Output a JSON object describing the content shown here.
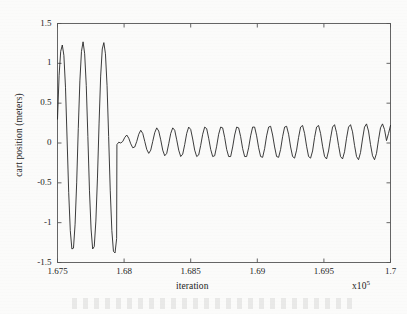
{
  "chart_data": {
    "type": "line",
    "title": "",
    "xlabel": "iteration",
    "ylabel": "cart position (meters)",
    "x_exponent": "x10",
    "x_exponent_power": "5",
    "xlim": [
      1.675,
      1.7
    ],
    "ylim": [
      -1.5,
      1.5
    ],
    "xticks": [
      "1.675",
      "1.68",
      "1.685",
      "1.69",
      "1.695",
      "1.7"
    ],
    "xtick_values": [
      1.675,
      1.68,
      1.685,
      1.69,
      1.695,
      1.7
    ],
    "yticks": [
      "1.5",
      "1",
      "0.5",
      "0",
      "-0.5",
      "-1",
      "-1.5"
    ],
    "ytick_values": [
      1.5,
      1,
      0.5,
      0,
      -0.5,
      -1,
      -1.5
    ],
    "grid": false,
    "legend": null,
    "line_color": "#262626",
    "line_width": 0.9,
    "series": [
      {
        "name": "cart position",
        "description": "Large amplitude oscillation for first three cycles then abrupt transition to small sustained oscillation",
        "points": [
          [
            1.675,
            0.3
          ],
          [
            1.67512,
            0.85
          ],
          [
            1.67524,
            1.15
          ],
          [
            1.67536,
            1.23
          ],
          [
            1.67548,
            1.1
          ],
          [
            1.6756,
            0.7
          ],
          [
            1.67572,
            0.05
          ],
          [
            1.67584,
            -0.62
          ],
          [
            1.67596,
            -1.1
          ],
          [
            1.67608,
            -1.33
          ],
          [
            1.6762,
            -1.32
          ],
          [
            1.67632,
            -1.02
          ],
          [
            1.67644,
            -0.5
          ],
          [
            1.67656,
            0.18
          ],
          [
            1.67668,
            0.78
          ],
          [
            1.6768,
            1.15
          ],
          [
            1.67692,
            1.27
          ],
          [
            1.67704,
            1.12
          ],
          [
            1.67716,
            0.72
          ],
          [
            1.67728,
            0.08
          ],
          [
            1.6774,
            -0.6
          ],
          [
            1.67752,
            -1.08
          ],
          [
            1.67764,
            -1.33
          ],
          [
            1.67776,
            -1.3
          ],
          [
            1.67788,
            -0.98
          ],
          [
            1.678,
            -0.44
          ],
          [
            1.67812,
            0.24
          ],
          [
            1.67824,
            0.84
          ],
          [
            1.67836,
            1.18
          ],
          [
            1.67848,
            1.26
          ],
          [
            1.6786,
            1.12
          ],
          [
            1.67872,
            0.72
          ],
          [
            1.67884,
            0.08
          ],
          [
            1.67896,
            -0.6
          ],
          [
            1.67908,
            -1.1
          ],
          [
            1.6792,
            -1.36
          ],
          [
            1.67932,
            -1.38
          ],
          [
            1.67944,
            -1.2
          ],
          [
            1.67946,
            -0.02
          ],
          [
            1.6796,
            0.01
          ],
          [
            1.67975,
            0.0
          ],
          [
            1.6799,
            0.02
          ],
          [
            1.68005,
            0.07
          ],
          [
            1.6802,
            0.1
          ],
          [
            1.68035,
            0.06
          ],
          [
            1.6805,
            -0.01
          ],
          [
            1.68065,
            -0.06
          ],
          [
            1.6808,
            -0.05
          ],
          [
            1.68095,
            0.02
          ],
          [
            1.6811,
            0.11
          ],
          [
            1.68125,
            0.16
          ],
          [
            1.6814,
            0.12
          ],
          [
            1.68155,
            0.02
          ],
          [
            1.6817,
            -0.08
          ],
          [
            1.68185,
            -0.13
          ],
          [
            1.682,
            -0.09
          ],
          [
            1.68215,
            0.02
          ],
          [
            1.6823,
            0.13
          ],
          [
            1.68245,
            0.19
          ],
          [
            1.6826,
            0.15
          ],
          [
            1.68275,
            0.04
          ],
          [
            1.6829,
            -0.09
          ],
          [
            1.68305,
            -0.16
          ],
          [
            1.6832,
            -0.13
          ],
          [
            1.68335,
            -0.01
          ],
          [
            1.6835,
            0.12
          ],
          [
            1.68365,
            0.19
          ],
          [
            1.6838,
            0.16
          ],
          [
            1.68395,
            0.04
          ],
          [
            1.6841,
            -0.09
          ],
          [
            1.68425,
            -0.17
          ],
          [
            1.6844,
            -0.14
          ],
          [
            1.68455,
            -0.02
          ],
          [
            1.6847,
            0.12
          ],
          [
            1.68485,
            0.2
          ],
          [
            1.685,
            0.17
          ],
          [
            1.68515,
            0.05
          ],
          [
            1.6853,
            -0.09
          ],
          [
            1.68545,
            -0.17
          ],
          [
            1.6856,
            -0.15
          ],
          [
            1.68575,
            -0.03
          ],
          [
            1.6859,
            0.11
          ],
          [
            1.68605,
            0.2
          ],
          [
            1.6862,
            0.18
          ],
          [
            1.68635,
            0.06
          ],
          [
            1.6865,
            -0.08
          ],
          [
            1.68665,
            -0.17
          ],
          [
            1.6868,
            -0.16
          ],
          [
            1.68695,
            -0.04
          ],
          [
            1.6871,
            0.11
          ],
          [
            1.68725,
            0.2
          ],
          [
            1.6874,
            0.19
          ],
          [
            1.68755,
            0.07
          ],
          [
            1.6877,
            -0.08
          ],
          [
            1.68785,
            -0.17
          ],
          [
            1.688,
            -0.17
          ],
          [
            1.68815,
            -0.05
          ],
          [
            1.6883,
            0.1
          ],
          [
            1.68845,
            0.2
          ],
          [
            1.6886,
            0.19
          ],
          [
            1.68875,
            0.08
          ],
          [
            1.6889,
            -0.07
          ],
          [
            1.68905,
            -0.17
          ],
          [
            1.6892,
            -0.17
          ],
          [
            1.68935,
            -0.06
          ],
          [
            1.6895,
            0.09
          ],
          [
            1.68965,
            0.2
          ],
          [
            1.6898,
            0.2
          ],
          [
            1.68995,
            0.09
          ],
          [
            1.6901,
            -0.06
          ],
          [
            1.69025,
            -0.17
          ],
          [
            1.6904,
            -0.18
          ],
          [
            1.69055,
            -0.07
          ],
          [
            1.6907,
            0.09
          ],
          [
            1.69085,
            0.2
          ],
          [
            1.691,
            0.21
          ],
          [
            1.69115,
            0.1
          ],
          [
            1.6913,
            -0.05
          ],
          [
            1.69145,
            -0.17
          ],
          [
            1.6916,
            -0.18
          ],
          [
            1.69175,
            -0.08
          ],
          [
            1.6919,
            0.08
          ],
          [
            1.69205,
            0.2
          ],
          [
            1.6922,
            0.21
          ],
          [
            1.69235,
            0.11
          ],
          [
            1.6925,
            -0.05
          ],
          [
            1.69265,
            -0.17
          ],
          [
            1.6928,
            -0.19
          ],
          [
            1.69295,
            -0.09
          ],
          [
            1.6931,
            0.07
          ],
          [
            1.69325,
            0.2
          ],
          [
            1.6934,
            0.22
          ],
          [
            1.69355,
            0.12
          ],
          [
            1.6937,
            -0.04
          ],
          [
            1.69385,
            -0.17
          ],
          [
            1.694,
            -0.19
          ],
          [
            1.69415,
            -0.1
          ],
          [
            1.6943,
            0.07
          ],
          [
            1.69445,
            0.2
          ],
          [
            1.6946,
            0.22
          ],
          [
            1.69475,
            0.12
          ],
          [
            1.6949,
            -0.04
          ],
          [
            1.69505,
            -0.17
          ],
          [
            1.6952,
            -0.2
          ],
          [
            1.69535,
            -0.1
          ],
          [
            1.6955,
            0.06
          ],
          [
            1.69565,
            0.2
          ],
          [
            1.6958,
            0.23
          ],
          [
            1.69595,
            0.13
          ],
          [
            1.6961,
            -0.03
          ],
          [
            1.69625,
            -0.17
          ],
          [
            1.6964,
            -0.2
          ],
          [
            1.69655,
            -0.11
          ],
          [
            1.6967,
            0.06
          ],
          [
            1.69685,
            0.2
          ],
          [
            1.697,
            0.23
          ],
          [
            1.69715,
            0.14
          ],
          [
            1.6973,
            -0.03
          ],
          [
            1.69745,
            -0.17
          ],
          [
            1.6976,
            -0.21
          ],
          [
            1.69775,
            -0.12
          ],
          [
            1.6979,
            0.05
          ],
          [
            1.69805,
            0.2
          ],
          [
            1.6982,
            0.24
          ],
          [
            1.69835,
            0.15
          ],
          [
            1.6985,
            -0.02
          ],
          [
            1.69865,
            -0.16
          ],
          [
            1.6988,
            -0.21
          ],
          [
            1.69895,
            -0.13
          ],
          [
            1.6991,
            0.04
          ],
          [
            1.69925,
            0.19
          ],
          [
            1.6994,
            0.24
          ],
          [
            1.69955,
            0.17
          ],
          [
            1.6997,
            0.03
          ],
          [
            1.69985,
            0.12
          ],
          [
            1.7,
            0.22
          ]
        ]
      }
    ]
  }
}
